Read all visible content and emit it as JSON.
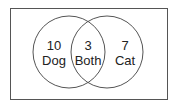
{
  "diagram": {
    "type": "venn",
    "sets": [
      {
        "id": "dog",
        "label": "Dog",
        "count": "10"
      },
      {
        "id": "cat",
        "label": "Cat",
        "count": "7"
      }
    ],
    "intersection": {
      "label": "Both",
      "count": "3"
    }
  },
  "colors": {
    "stroke": "#555555",
    "text": "#222222",
    "background": "#ffffff"
  }
}
